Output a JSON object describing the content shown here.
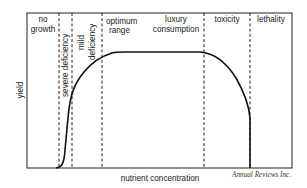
{
  "diagram": {
    "title": "",
    "y_axis_label": "yield",
    "x_axis_label": "nutrient concentration",
    "credit": "Annual Reviews Inc.",
    "zones": [
      {
        "name": "no-growth",
        "lines": [
          "no",
          "growth"
        ],
        "orientation": "horizontal"
      },
      {
        "name": "severe-deficiency",
        "lines": [
          "severe deficiency"
        ],
        "orientation": "vertical"
      },
      {
        "name": "mild-deficiency",
        "lines": [
          "mild",
          "deficiency"
        ],
        "orientation": "vertical"
      },
      {
        "name": "optimum-range",
        "lines": [
          "optimum",
          "range"
        ],
        "orientation": "horizontal"
      },
      {
        "name": "luxury-consumption",
        "lines": [
          "luxury",
          "consumption"
        ],
        "orientation": "horizontal"
      },
      {
        "name": "toxicity",
        "lines": [
          "toxicity"
        ],
        "orientation": "horizontal"
      },
      {
        "name": "lethality",
        "lines": [
          "lethality"
        ],
        "orientation": "horizontal"
      }
    ],
    "curve_description": "Yield rises steeply from zero through severe and mild deficiency, plateaus across the optimum range and luxury consumption, declines in the toxicity zone and drops to zero at the onset of lethality.",
    "colors": {
      "line": "#111111",
      "frame": "#222222",
      "text": "#222222"
    }
  }
}
